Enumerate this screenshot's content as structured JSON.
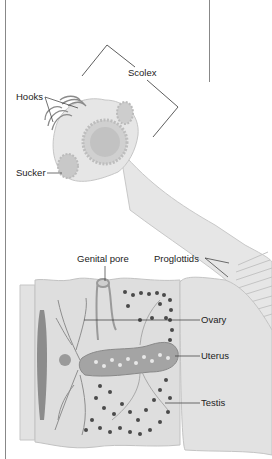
{
  "diagram": {
    "labels": {
      "scolex": "Scolex",
      "hooks": "Hooks",
      "sucker": "Sucker",
      "genital_pore": "Genital pore",
      "proglottids": "Proglottids",
      "ovary": "Ovary",
      "uterus": "Uterus",
      "testis": "Testis"
    },
    "colors": {
      "body_fill": "#e4e4e4",
      "body_stroke": "#b5b5b5",
      "segment_fill": "#dcdcdc",
      "organ_dark": "#555555",
      "uterus_fill": "#a8a8a8",
      "line": "#333333"
    }
  }
}
